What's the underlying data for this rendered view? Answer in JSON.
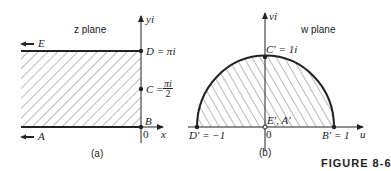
{
  "figure": {
    "caption": "FIGURE 8-6",
    "panels": [
      {
        "id": "a",
        "sublabel": "(a)",
        "plane_label": "z plane",
        "axes": {
          "horizontal": "x",
          "vertical": "yi",
          "origin": "0"
        },
        "points": [
          {
            "name": "D",
            "label": "D = πi",
            "value": "πi"
          },
          {
            "name": "C",
            "label_prefix": "C =",
            "numerator": "πi",
            "denominator": "2"
          },
          {
            "name": "B",
            "label": "B"
          }
        ],
        "arrows": [
          {
            "name": "E",
            "label": "E",
            "direction": "left"
          },
          {
            "name": "A",
            "label": "A",
            "direction": "left"
          }
        ],
        "region": "hatched semi-infinite strip 0 ≤ y ≤ π, x ≤ 0"
      },
      {
        "id": "b",
        "sublabel": "(b)",
        "plane_label": "w plane",
        "axes": {
          "horizontal": "u",
          "vertical": "vi",
          "origin": "0"
        },
        "points": [
          {
            "name": "C'",
            "label": "C′ = 1i"
          },
          {
            "name": "D'",
            "label": "D′ = −1"
          },
          {
            "name": "B'",
            "label": "B′ = 1"
          },
          {
            "name": "E'A'",
            "label": "E′, A′"
          }
        ],
        "region": "hatched upper half unit disk"
      }
    ]
  },
  "colors": {
    "ink": "#222222",
    "hatch": "#555555",
    "background": "#ffffff"
  }
}
